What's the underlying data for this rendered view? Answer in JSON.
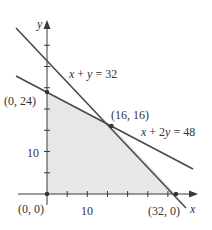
{
  "diagram": {
    "axes": {
      "x_label": "x",
      "y_label": "y",
      "x_tick_label": "10",
      "y_tick_label": "10"
    },
    "lines": [
      {
        "id": "line-x-plus-y",
        "equation": "x + y = 32",
        "label_parts": [
          "x",
          " + ",
          "y",
          " = 32"
        ]
      },
      {
        "id": "line-x-plus-2y",
        "equation": "x + 2y = 48",
        "label_parts": [
          "x",
          " + 2",
          "y",
          " = 48"
        ]
      }
    ],
    "vertices": [
      {
        "label": "(0, 24)",
        "x": 0,
        "y": 24
      },
      {
        "label": "(16, 16)",
        "x": 16,
        "y": 16
      },
      {
        "label": "(0, 0)",
        "x": 0,
        "y": 0
      },
      {
        "label": "(32, 0)",
        "x": 32,
        "y": 0
      }
    ],
    "feasible_region": "Shaded polygon with vertices (0,0), (0,24), (16,16), (32,0)",
    "colors": {
      "region_fill": "#e6e7e9",
      "line_color": "#4a4a4a",
      "axis_color": "#3a3a3a",
      "text_color": "#333333"
    }
  }
}
